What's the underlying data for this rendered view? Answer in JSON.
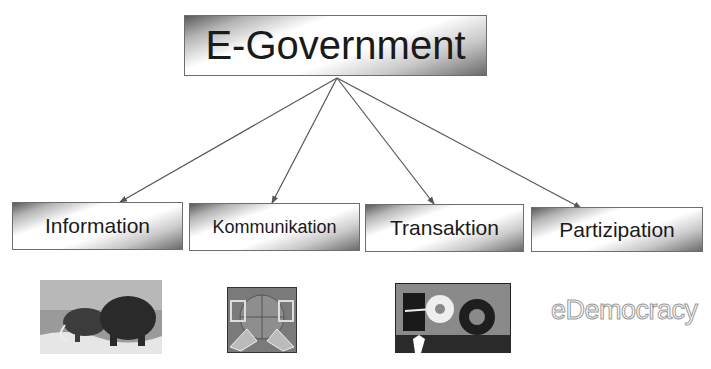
{
  "diagram": {
    "root": {
      "label": "E-Government"
    },
    "children": [
      {
        "label": "Information"
      },
      {
        "label": "Kommunikation"
      },
      {
        "label": "Transaktion"
      },
      {
        "label": "Partizipation"
      }
    ],
    "illustrations": [
      {
        "name": "mammoths-picture"
      },
      {
        "name": "computers-globe-picture"
      },
      {
        "name": "person-gears-picture"
      },
      {
        "name": "edemocracy-wordart",
        "text": "eDemocracy"
      }
    ],
    "colors": {
      "border": "#6e6e6e",
      "text": "#1a1a1a",
      "arrow": "#555555"
    }
  }
}
